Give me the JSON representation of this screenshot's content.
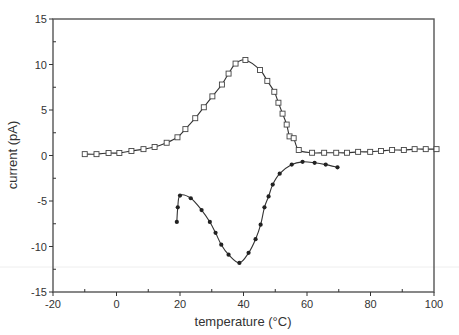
{
  "chart_data": {
    "type": "line",
    "title": "",
    "xlabel": "temperature (°C)",
    "ylabel": "current (pA)",
    "xlim": [
      -20,
      100
    ],
    "ylim": [
      -15,
      15
    ],
    "x_ticks": [
      -20,
      0,
      20,
      40,
      60,
      80,
      100
    ],
    "x_minor_step": 10,
    "y_ticks": [
      -15,
      -10,
      -5,
      0,
      5,
      10,
      15
    ],
    "y_minor_step": 2.5,
    "grid": false,
    "legend": null,
    "series": [
      {
        "name": "heating (upper curve)",
        "marker": "open-square",
        "x": [
          -10,
          -6.3,
          -2.5,
          0.9,
          4.7,
          8.5,
          12,
          15.8,
          19.2,
          21.7,
          24.8,
          27.5,
          30.2,
          33.2,
          35.3,
          37.5,
          40.6,
          45.2,
          47.5,
          49.7,
          51.0,
          52.3,
          53.6,
          54.5,
          55.8,
          57.4,
          61.6,
          65.4,
          69.2,
          72.6,
          76.1,
          79.9,
          83.3,
          86.8,
          90.5,
          93.9,
          97.4,
          100.8
        ],
        "y": [
          0.15,
          0.15,
          0.27,
          0.27,
          0.5,
          0.7,
          0.93,
          1.4,
          2.0,
          2.9,
          4.1,
          5.3,
          6.5,
          7.8,
          9.0,
          10.1,
          10.5,
          9.4,
          8.2,
          7.0,
          5.8,
          4.6,
          3.4,
          2.1,
          1.9,
          0.6,
          0.3,
          0.3,
          0.3,
          0.3,
          0.4,
          0.4,
          0.5,
          0.6,
          0.6,
          0.7,
          0.7,
          0.7
        ]
      },
      {
        "name": "cooling (lower curve)",
        "marker": "filled-circle",
        "x": [
          19,
          19.3,
          20,
          23.4,
          26.8,
          29.4,
          31.2,
          33,
          35.3,
          38.7,
          41.6,
          43.8,
          45.4,
          46.6,
          47.9,
          49.2,
          51.4,
          55.2,
          58.6,
          62.4,
          65.9,
          69.6
        ],
        "y": [
          -7.3,
          -5.7,
          -4.4,
          -4.7,
          -6.0,
          -7.3,
          -8.5,
          -9.8,
          -10.9,
          -11.8,
          -10.7,
          -9.2,
          -7.6,
          -5.7,
          -4.5,
          -3.2,
          -2.0,
          -1.0,
          -0.7,
          -0.8,
          -1.0,
          -1.3
        ]
      }
    ]
  },
  "colors": {
    "axis": "#333333",
    "frame": "#555555",
    "line": "#333333",
    "marker_fill": "#ffffff",
    "marker_stroke": "#444444",
    "dot": "#222222",
    "tick_label": "#333333"
  }
}
